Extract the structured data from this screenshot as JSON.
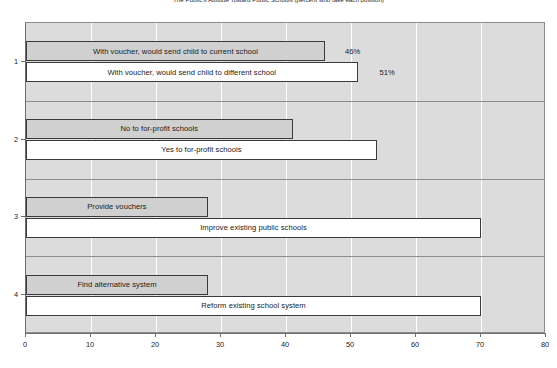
{
  "chart_data": {
    "type": "bar",
    "orientation": "horizontal",
    "title": "The Public's Attitude Toward Public Schools (percent who take each position)",
    "xlabel": "",
    "ylabel": "",
    "xlim": [
      0,
      80
    ],
    "xticks": [
      0,
      10,
      20,
      30,
      40,
      50,
      60,
      70,
      80
    ],
    "xticklabels": [
      "0",
      "10",
      "20",
      "30",
      "40",
      "50",
      "60",
      "70",
      "80"
    ],
    "yticklabels": [
      "1",
      "2",
      "3",
      "4"
    ],
    "grid": "vertical",
    "legend": "none",
    "groups": [
      {
        "group_label": "1",
        "bars": [
          {
            "label": "With voucher, would send child to current school",
            "value": 46,
            "style": "shaded",
            "value_label": "46%"
          },
          {
            "label": "With voucher, would send child to different school",
            "value": 51,
            "style": "plain",
            "value_label": "51%"
          }
        ]
      },
      {
        "group_label": "2",
        "bars": [
          {
            "label": "No to for-profit schools",
            "value": 41,
            "style": "shaded",
            "value_label": ""
          },
          {
            "label": "Yes to for-profit schools",
            "value": 54,
            "style": "plain",
            "value_label": ""
          }
        ]
      },
      {
        "group_label": "3",
        "bars": [
          {
            "label": "Provide vouchers",
            "value": 28,
            "style": "shaded",
            "value_label": ""
          },
          {
            "label": "Improve existing public schools",
            "value": 70,
            "style": "plain",
            "value_label": ""
          }
        ]
      },
      {
        "group_label": "4",
        "bars": [
          {
            "label": "Find alternative system",
            "value": 28,
            "style": "shaded",
            "value_label": ""
          },
          {
            "label": "Reform existing school system",
            "value": 70,
            "style": "plain",
            "value_label": ""
          }
        ]
      }
    ],
    "colors": {
      "plot_background": "#dcdcdc",
      "shaded_bar": "#d0d0d0",
      "plain_bar": "#ffffff",
      "bar_border": "#3a3a3a",
      "gridline": "#ffffff",
      "axis": "#6f6f6f",
      "text": "#1a1a1a"
    }
  }
}
